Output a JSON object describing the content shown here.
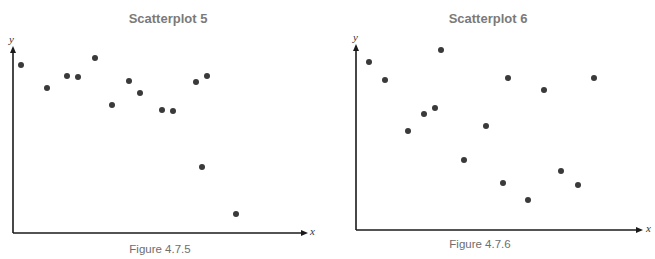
{
  "chart_data": [
    {
      "type": "scatter",
      "title": "Scatterplot 5",
      "caption": "Figure 4.7.5",
      "xlabel": "x",
      "ylabel": "y",
      "grid": false,
      "legend": null,
      "x_range_px": [
        13,
        307
      ],
      "y_range_px": [
        47,
        233
      ],
      "points": [
        {
          "x": 8,
          "y": 168
        },
        {
          "x": 34,
          "y": 145
        },
        {
          "x": 54,
          "y": 157
        },
        {
          "x": 65,
          "y": 156
        },
        {
          "x": 82,
          "y": 175
        },
        {
          "x": 99,
          "y": 128
        },
        {
          "x": 116,
          "y": 152
        },
        {
          "x": 127,
          "y": 140
        },
        {
          "x": 149,
          "y": 123
        },
        {
          "x": 160,
          "y": 122
        },
        {
          "x": 183,
          "y": 151
        },
        {
          "x": 194,
          "y": 157
        },
        {
          "x": 189,
          "y": 66
        },
        {
          "x": 223,
          "y": 19
        }
      ],
      "note": "Point coordinates are in pixel units relative to the axes origin (no tick values shown)."
    },
    {
      "type": "scatter",
      "title": "Scatterplot 6",
      "caption": "Figure 4.7.6",
      "xlabel": "x",
      "ylabel": "y",
      "grid": false,
      "legend": null,
      "x_range_px": [
        356,
        642
      ],
      "y_range_px": [
        45,
        230
      ],
      "points": [
        {
          "x": 13,
          "y": 168
        },
        {
          "x": 29,
          "y": 150
        },
        {
          "x": 85,
          "y": 180
        },
        {
          "x": 52,
          "y": 99
        },
        {
          "x": 68,
          "y": 116
        },
        {
          "x": 79,
          "y": 122
        },
        {
          "x": 152,
          "y": 152
        },
        {
          "x": 188,
          "y": 140
        },
        {
          "x": 238,
          "y": 152
        },
        {
          "x": 130,
          "y": 104
        },
        {
          "x": 108,
          "y": 70
        },
        {
          "x": 147,
          "y": 47
        },
        {
          "x": 172,
          "y": 30
        },
        {
          "x": 205,
          "y": 59
        },
        {
          "x": 222,
          "y": 45
        }
      ],
      "note": "Point coordinates are in pixel units relative to the axes origin (no tick values shown)."
    }
  ],
  "plots": [
    {
      "title": "Scatterplot 5",
      "caption": "Figure 4.7.5",
      "x_label": "x",
      "y_label": "y",
      "origin": [
        13,
        233
      ],
      "x_end": 307,
      "y_end": 47,
      "dots": [
        [
          21,
          65
        ],
        [
          47,
          88
        ],
        [
          67,
          76
        ],
        [
          78,
          77
        ],
        [
          95,
          58
        ],
        [
          112,
          105
        ],
        [
          129,
          81
        ],
        [
          140,
          93
        ],
        [
          162,
          110
        ],
        [
          173,
          111
        ],
        [
          196,
          82
        ],
        [
          207,
          76
        ],
        [
          202,
          167
        ],
        [
          236,
          214
        ]
      ]
    },
    {
      "title": "Scatterplot 6",
      "caption": "Figure 4.7.6",
      "x_label": "x",
      "y_label": "y",
      "origin": [
        356,
        230
      ],
      "x_end": 642,
      "y_end": 45,
      "dots": [
        [
          369,
          62
        ],
        [
          385,
          80
        ],
        [
          441,
          50
        ],
        [
          408,
          131
        ],
        [
          424,
          114
        ],
        [
          435,
          108
        ],
        [
          508,
          78
        ],
        [
          544,
          90
        ],
        [
          594,
          78
        ],
        [
          486,
          126
        ],
        [
          464,
          160
        ],
        [
          503,
          183
        ],
        [
          528,
          200
        ],
        [
          561,
          171
        ],
        [
          578,
          185
        ]
      ]
    }
  ],
  "colors": {
    "dot": "#3a3a3a",
    "axis": "#1a1a1a",
    "title": "#7a7a7a",
    "caption": "#6e6e6e"
  }
}
